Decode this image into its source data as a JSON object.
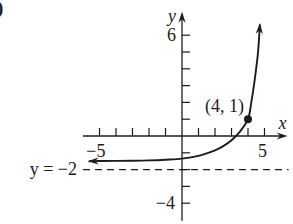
{
  "figure_label": ")",
  "colors": {
    "ink": "#1c1c1c",
    "background": "#ffffff"
  },
  "chart_data": {
    "type": "line",
    "title": "",
    "xlabel": "x",
    "ylabel": "y",
    "xlim": [
      -6.0,
      6.4
    ],
    "ylim": [
      -5.05,
      7.4
    ],
    "grid": false,
    "x_ticks": [
      -5,
      -4,
      -3,
      -2,
      -1,
      1,
      2,
      3,
      4,
      5
    ],
    "y_ticks": [
      6,
      5,
      4,
      3,
      2,
      1,
      -1,
      -2,
      -3,
      -4
    ],
    "x_tick_labels": [
      {
        "value": -5,
        "label": "−5"
      },
      {
        "value": 5,
        "label": "5"
      }
    ],
    "y_tick_labels": [
      {
        "value": 6,
        "label": "6"
      },
      {
        "value": -4,
        "label": "−4"
      }
    ],
    "series": [
      {
        "name": "exponential-curve",
        "arrows": "both-ends",
        "points": [
          [
            -5.6,
            -1.5
          ],
          [
            -5.0,
            -1.49
          ],
          [
            -3.0,
            -1.47
          ],
          [
            -2.0,
            -1.45
          ],
          [
            -1.0,
            -1.41
          ],
          [
            0.0,
            -1.35
          ],
          [
            1.0,
            -1.18
          ],
          [
            2.0,
            -0.85
          ],
          [
            2.5,
            -0.6
          ],
          [
            3.0,
            -0.25
          ],
          [
            3.5,
            0.25
          ],
          [
            4.0,
            1.0
          ],
          [
            4.2,
            2.0
          ],
          [
            4.4,
            3.3
          ],
          [
            4.6,
            4.9
          ],
          [
            4.72,
            6.6
          ]
        ]
      }
    ],
    "asymptote": {
      "y": -2,
      "label": "y = −2",
      "style": "dashed"
    },
    "annotations": [
      {
        "x": 4,
        "y": 1,
        "label": "(4, 1)",
        "marker": "filled-circle"
      }
    ]
  }
}
